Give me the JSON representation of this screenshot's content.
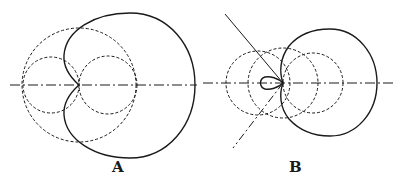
{
  "figure": {
    "panels": [
      {
        "id": "A",
        "label": "A",
        "description": "Cardioid (solid) constructed from dashed circles with dash-dot horizontal axis"
      },
      {
        "id": "B",
        "label": "B",
        "description": "Limaçon with inner loop (solid) constructed from dashed circles, dash-dot axis and two tangent lines through the node"
      }
    ],
    "colors": {
      "ink": "#1a1a1a",
      "background": "#ffffff"
    },
    "line_styles": {
      "curve": "solid",
      "construction_circles": "dashed",
      "axis": "dash-dot"
    }
  }
}
